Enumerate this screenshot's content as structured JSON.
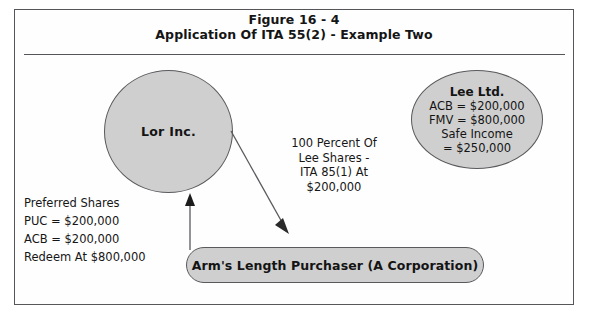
{
  "figure": {
    "title_line1": "Figure 16 - 4",
    "title_line2": "Application Of ITA 55(2) - Example Two"
  },
  "nodes": {
    "lor_inc": {
      "label": "Lor Inc.",
      "shape": "circle"
    },
    "lee_ltd": {
      "name": "Lee Ltd.",
      "acb": "ACB = $200,000",
      "fmv": "FMV = $800,000",
      "safe_income_label": "Safe Income",
      "safe_income_value": "= $250,000",
      "shape": "circle"
    },
    "purchaser": {
      "label": "Arm's Length Purchaser (A Corporation)",
      "shape": "rounded-pill"
    }
  },
  "annotations": {
    "transfer_note": {
      "line1": "100 Percent Of",
      "line2": "Lee Shares -",
      "line3": "ITA 85(1) At",
      "line4": "$200,000"
    },
    "preferred_shares": {
      "line1": "Preferred Shares",
      "line2": "PUC = $200,000",
      "line3": "ACB = $200,000",
      "line4": "Redeem At $800,000"
    }
  },
  "arrows": {
    "diagonal": {
      "name": "lor-inc-to-purchaser-arrow",
      "from": "Lor Inc.",
      "to": "Arm's Length Purchaser (A Corporation)",
      "direction": "down-right"
    },
    "vertical": {
      "name": "purchaser-to-lor-inc-arrow",
      "from": "Arm's Length Purchaser (A Corporation)",
      "to": "Lor Inc.",
      "direction": "up"
    }
  },
  "colors": {
    "shape_fill": "#cfcfcf",
    "shape_stroke": "#5a5a5e",
    "border": "#55555a",
    "text": "#141414",
    "background": "#ffffff"
  }
}
